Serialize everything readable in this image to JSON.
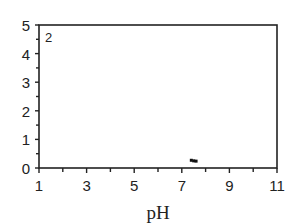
{
  "chart_data": {
    "type": "scatter",
    "title": "",
    "panel_label": "2",
    "xlabel": "pH",
    "ylabel": "",
    "xlim": [
      1,
      11
    ],
    "ylim": [
      0,
      5
    ],
    "xticks": [
      1,
      3,
      5,
      7,
      9,
      11
    ],
    "xminor": [
      2,
      4,
      6,
      8,
      10
    ],
    "yticks": [
      0,
      1,
      2,
      3,
      4,
      5
    ],
    "yminor": [
      0.5,
      1.5,
      2.5,
      3.5,
      4.5
    ],
    "grid": false,
    "legend": null,
    "series": [
      {
        "name": "data",
        "x": [
          7.4,
          7.5,
          7.6
        ],
        "y": [
          0.27,
          0.25,
          0.24
        ],
        "color": "#111111"
      }
    ]
  }
}
